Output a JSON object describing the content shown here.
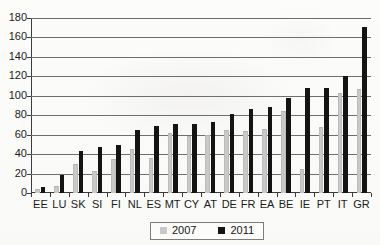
{
  "chart_data": {
    "type": "bar",
    "title": "",
    "subtitle": "",
    "xlabel": "",
    "ylabel": "",
    "ylim": [
      0,
      180
    ],
    "ytick_step": 20,
    "yticks": [
      0,
      20,
      40,
      60,
      80,
      100,
      120,
      140,
      160,
      180
    ],
    "grid": true,
    "legend_position": "bottom-center",
    "categories": [
      "EE",
      "LU",
      "SK",
      "SI",
      "FI",
      "NL",
      "ES",
      "MT",
      "CY",
      "AT",
      "DE",
      "FR",
      "EA",
      "BE",
      "IE",
      "PT",
      "IT",
      "GR"
    ],
    "series": [
      {
        "name": "2007",
        "color": "#c9c9c9",
        "values": [
          4,
          7,
          30,
          23,
          35,
          45,
          36,
          62,
          59,
          60,
          65,
          64,
          66,
          84,
          25,
          68,
          103,
          107
        ]
      },
      {
        "name": "2011",
        "color": "#141414",
        "values": [
          6,
          19,
          43,
          47,
          49,
          65,
          69,
          71,
          71,
          73,
          81,
          86,
          88,
          98,
          108,
          108,
          120,
          171
        ]
      }
    ]
  },
  "legend": {
    "entries": [
      {
        "label": "2007",
        "swatch": "s2007"
      },
      {
        "label": "2011",
        "swatch": "s2011"
      }
    ]
  },
  "axes": {
    "y_tick_labels": [
      "180",
      "160",
      "140",
      "120",
      "100",
      "80",
      "60",
      "40",
      "20",
      "0"
    ],
    "x_tick_labels": [
      "EE",
      "LU",
      "SK",
      "SI",
      "FI",
      "NL",
      "ES",
      "MT",
      "CY",
      "AT",
      "DE",
      "FR",
      "EA",
      "BE",
      "IE",
      "PT",
      "IT",
      "GR"
    ]
  },
  "colors": {
    "series_2007": "#c9c9c9",
    "series_2011": "#141414",
    "axis": "#3b3b3b",
    "gridline": "#6e6e6e",
    "background": "#fbfbfa"
  }
}
